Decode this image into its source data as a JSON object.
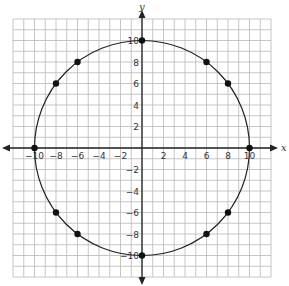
{
  "chart_data": {
    "type": "scatter",
    "title": "",
    "xlabel": "x",
    "ylabel": "y",
    "xlim": [
      -12,
      12
    ],
    "ylim": [
      -12,
      12
    ],
    "grid": true,
    "x_ticks": [
      -10,
      -8,
      -6,
      -4,
      -2,
      2,
      4,
      6,
      8,
      10
    ],
    "y_ticks": [
      -10,
      -8,
      -6,
      -4,
      -2,
      2,
      4,
      6,
      8,
      10
    ],
    "curve": {
      "shape": "circle",
      "center": [
        0,
        0
      ],
      "radius": 10
    },
    "points": [
      {
        "x": 0,
        "y": 10
      },
      {
        "x": 6,
        "y": 8
      },
      {
        "x": 8,
        "y": 6
      },
      {
        "x": 10,
        "y": 0
      },
      {
        "x": 8,
        "y": -6
      },
      {
        "x": 6,
        "y": -8
      },
      {
        "x": 0,
        "y": -10
      },
      {
        "x": -6,
        "y": -8
      },
      {
        "x": -8,
        "y": -6
      },
      {
        "x": -10,
        "y": 0
      },
      {
        "x": -8,
        "y": 6
      },
      {
        "x": -6,
        "y": 8
      }
    ]
  },
  "colors": {
    "grid": "#b8b8b8",
    "axis": "#222222",
    "curve": "#222222",
    "point": "#111111"
  }
}
